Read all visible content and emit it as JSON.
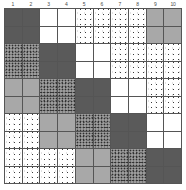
{
  "figure": {
    "type": "matrix-grid",
    "rows": 10,
    "cols": 10,
    "block_size": 2
  },
  "column_labels": [
    "1",
    "2",
    "3",
    "4",
    "5",
    "6",
    "7",
    "8",
    "9",
    "10"
  ],
  "legend": {
    "dark": "dark-gray-solid",
    "white": "empty-white",
    "stipple": "light-stipple",
    "noise": "dark-speckle",
    "medium": "medium-gray-solid"
  },
  "colors": {
    "dark": "#5a5a5a",
    "medium": "#a8a8a8",
    "white": "#ffffff",
    "noise_base": "#7a7a7a",
    "stipple_base": "#ffffff",
    "gridline": "#555555",
    "label_text": "#4a4a4a"
  },
  "chart_data": {
    "type": "heatmap",
    "title": "",
    "xlabel": "",
    "ylabel": "",
    "x": [
      "1",
      "2",
      "3",
      "4",
      "5",
      "6",
      "7",
      "8",
      "9",
      "10"
    ],
    "y": [
      "1",
      "2",
      "3",
      "4",
      "5",
      "6",
      "7",
      "8",
      "9",
      "10"
    ],
    "categories": [
      "dark",
      "white",
      "stipple",
      "stipple",
      "medium"
    ],
    "block_grid": [
      [
        "dark",
        "white",
        "stipple",
        "stipple",
        "medium"
      ],
      [
        "noise",
        "dark",
        "white",
        "stipple",
        "stipple"
      ],
      [
        "medium",
        "noise",
        "dark",
        "white",
        "stipple"
      ],
      [
        "stipple",
        "medium",
        "noise",
        "dark",
        "white"
      ],
      [
        "stipple",
        "stipple",
        "medium",
        "noise",
        "dark"
      ]
    ],
    "cell_grid": [
      [
        "dark",
        "dark",
        "white",
        "white",
        "stipple",
        "stipple",
        "stipple",
        "stipple",
        "medium",
        "medium"
      ],
      [
        "dark",
        "dark",
        "white",
        "white",
        "stipple",
        "stipple",
        "stipple",
        "stipple",
        "medium",
        "medium"
      ],
      [
        "noise",
        "noise",
        "dark",
        "dark",
        "white",
        "white",
        "stipple",
        "stipple",
        "stipple",
        "stipple"
      ],
      [
        "noise",
        "noise",
        "dark",
        "dark",
        "white",
        "white",
        "stipple",
        "stipple",
        "stipple",
        "stipple"
      ],
      [
        "medium",
        "medium",
        "noise",
        "noise",
        "dark",
        "dark",
        "white",
        "white",
        "stipple",
        "stipple"
      ],
      [
        "medium",
        "medium",
        "noise",
        "noise",
        "dark",
        "dark",
        "white",
        "white",
        "stipple",
        "stipple"
      ],
      [
        "stipple",
        "stipple",
        "medium",
        "medium",
        "noise",
        "noise",
        "dark",
        "dark",
        "white",
        "white"
      ],
      [
        "stipple",
        "stipple",
        "medium",
        "medium",
        "noise",
        "noise",
        "dark",
        "dark",
        "white",
        "white"
      ],
      [
        "stipple",
        "stipple",
        "stipple",
        "stipple",
        "medium",
        "medium",
        "noise",
        "noise",
        "dark",
        "dark"
      ],
      [
        "stipple",
        "stipple",
        "stipple",
        "stipple",
        "medium",
        "medium",
        "noise",
        "noise",
        "dark",
        "dark"
      ]
    ],
    "grid": true,
    "legend_position": "none"
  }
}
